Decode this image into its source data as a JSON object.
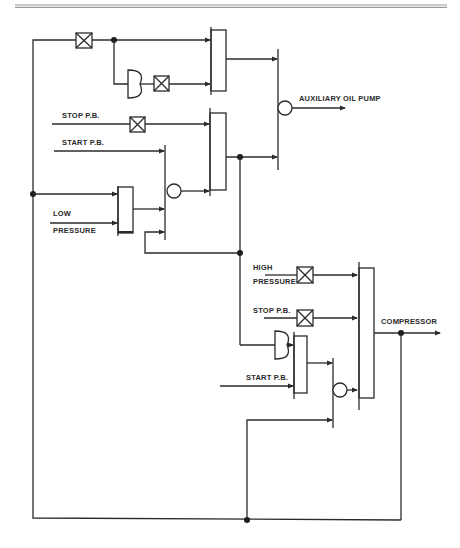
{
  "diagram": {
    "type": "logic control diagram",
    "labels": {
      "auxiliary_oil_pump": "AUXILIARY OIL PUMP",
      "stop_pb_upper": "STOP P.B.",
      "start_pb_upper": "START P.B.",
      "low": "LOW",
      "pressure_low": "PRESSURE",
      "high": "HIGH",
      "pressure_high": "PRESSURE",
      "stop_pb_lower": "STOP P.B.",
      "compressor": "COMPRESSOR",
      "start_pb_lower": "START P.B."
    },
    "symbols": {
      "inhibit_box": "x-box-icon (NOT / inhibit)",
      "and_gate": "half-circle (D-shape) gate",
      "or_gate": "vertical bar block gate",
      "memory_circle": "circle (memory / delay)",
      "junction": "filled dot"
    },
    "outputs": [
      "AUXILIARY OIL PUMP",
      "COMPRESSOR"
    ],
    "inputs": [
      "STOP P.B.",
      "START P.B.",
      "LOW PRESSURE",
      "HIGH PRESSURE",
      "STOP P.B.",
      "START P.B."
    ],
    "colors": {
      "line": "#2b2b2b",
      "background": "#ffffff",
      "rule": "#9a9a9a"
    }
  }
}
